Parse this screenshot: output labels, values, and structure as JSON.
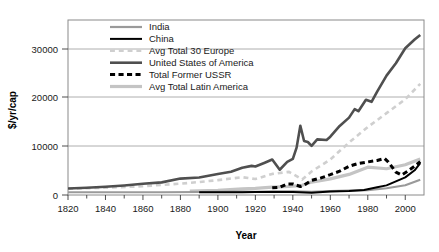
{
  "chart_data": {
    "type": "line",
    "title": "",
    "xlabel": "Year",
    "ylabel": "$/yr/cap",
    "xlim": [
      1820,
      2010
    ],
    "ylim": [
      0,
      34000
    ],
    "grid": "horizontal",
    "legend_position": "top-left-inside",
    "xticks": [
      1820,
      1840,
      1860,
      1880,
      1900,
      1920,
      1940,
      1960,
      1980,
      2000
    ],
    "xtick_labels": [
      "1820",
      "1840",
      "1860",
      "1880",
      "1900",
      "1920",
      "1940",
      "1960",
      "1980",
      "2000"
    ],
    "yticks": [
      0,
      10000,
      20000,
      30000
    ],
    "ytick_labels": [
      "0",
      "10000",
      "20000",
      "30000"
    ],
    "series": [
      {
        "name": "India",
        "color": "#9a9a9a",
        "style": "solid",
        "width": 2.2,
        "x": [
          1820,
          1850,
          1870,
          1890,
          1900,
          1913,
          1920,
          1929,
          1940,
          1950,
          1960,
          1970,
          1980,
          1990,
          2000,
          2008
        ],
        "values": [
          530,
          530,
          533,
          584,
          599,
          673,
          635,
          728,
          686,
          619,
          753,
          868,
          938,
          1309,
          1892,
          2975
        ]
      },
      {
        "name": "China",
        "color": "#000000",
        "style": "solid",
        "width": 2.0,
        "x": [
          1890,
          1900,
          1913,
          1920,
          1929,
          1940,
          1950,
          1960,
          1970,
          1978,
          1985,
          1990,
          1995,
          2000,
          2005,
          2008
        ],
        "values": [
          540,
          545,
          552,
          560,
          562,
          562,
          448,
          673,
          778,
          979,
          1522,
          1871,
          2653,
          3421,
          4803,
          6188
        ]
      },
      {
        "name": "Avg Total 30 Europe",
        "color": "#cfcfcf",
        "style": "dashed",
        "width": 2.6,
        "x": [
          1820,
          1840,
          1860,
          1870,
          1880,
          1890,
          1900,
          1913,
          1920,
          1929,
          1938,
          1945,
          1950,
          1960,
          1970,
          1980,
          1990,
          2000,
          2008
        ],
        "values": [
          1200,
          1420,
          1700,
          1960,
          2200,
          2520,
          2890,
          3460,
          3100,
          4100,
          4500,
          3000,
          4570,
          6900,
          10200,
          13200,
          15900,
          18600,
          21600
        ]
      },
      {
        "name": "United States of America",
        "color": "#4f4f4f",
        "style": "solid",
        "width": 2.6,
        "x": [
          1820,
          1830,
          1840,
          1850,
          1860,
          1870,
          1880,
          1890,
          1900,
          1907,
          1913,
          1918,
          1920,
          1925,
          1929,
          1933,
          1937,
          1940,
          1942,
          1944,
          1946,
          1948,
          1950,
          1953,
          1958,
          1960,
          1965,
          1970,
          1973,
          1975,
          1979,
          1982,
          1985,
          1990,
          1995,
          2000,
          2005,
          2008
        ],
        "values": [
          1260,
          1400,
          1590,
          1850,
          2180,
          2450,
          3190,
          3390,
          4090,
          4500,
          5300,
          5660,
          5550,
          6280,
          6900,
          4910,
          6430,
          7010,
          9200,
          13450,
          10500,
          10300,
          9560,
          10800,
          10700,
          11330,
          13420,
          15030,
          16690,
          16280,
          18500,
          18100,
          20100,
          23200,
          25600,
          28500,
          30200,
          31100
        ]
      },
      {
        "name": "Total Former USSR",
        "color": "#000000",
        "style": "dashed-thick",
        "width": 3.0,
        "x": [
          1929,
          1933,
          1937,
          1940,
          1944,
          1946,
          1950,
          1955,
          1960,
          1965,
          1970,
          1975,
          1980,
          1985,
          1989,
          1991,
          1995,
          1998,
          2001,
          2005,
          2008
        ],
        "values": [
          1386,
          1493,
          2156,
          2144,
          1650,
          1913,
          2841,
          3313,
          3945,
          4634,
          5575,
          6135,
          6426,
          6708,
          7100,
          6400,
          4440,
          3890,
          4550,
          5600,
          6500
        ]
      },
      {
        "name": "Avg Total Latin America",
        "color": "#c4c4c4",
        "style": "solid",
        "width": 3.2,
        "x": [
          1885,
          1900,
          1913,
          1920,
          1929,
          1938,
          1945,
          1950,
          1960,
          1970,
          1980,
          1990,
          2000,
          2008
        ],
        "values": [
          740,
          900,
          1190,
          1280,
          1540,
          1650,
          1880,
          2510,
          3140,
          4000,
          5400,
          5100,
          5880,
          7000
        ]
      }
    ]
  },
  "legend": {
    "items": [
      {
        "label": "India",
        "swatch": "india-swatch"
      },
      {
        "label": "China",
        "swatch": "china-swatch"
      },
      {
        "label": "Avg Total 30 Europe",
        "swatch": "europe-swatch"
      },
      {
        "label": "United States of America",
        "swatch": "usa-swatch"
      },
      {
        "label": "Total Former USSR",
        "swatch": "ussr-swatch"
      },
      {
        "label": "Avg Total Latin America",
        "swatch": "latam-swatch"
      }
    ]
  },
  "axes": {
    "y_title": "$/yr/cap",
    "x_title": "Year"
  }
}
